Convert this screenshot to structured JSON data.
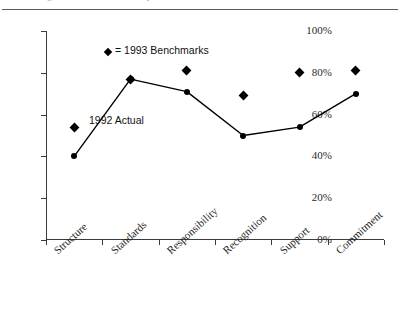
{
  "page": {
    "top_text_sliver": "Exhibit 2  Organizational climate survey results",
    "background_color": "#ffffff",
    "ink_color": "#000000"
  },
  "chart_data": {
    "type": "line",
    "title": "",
    "subtitle": "",
    "xlabel": "",
    "ylabel": "",
    "ylim": [
      0,
      100
    ],
    "y_unit": "%",
    "grid": false,
    "legend_position": "inside-top-center",
    "categories": [
      "Structure",
      "Standards",
      "Responsibility",
      "Recognition",
      "Support",
      "Commitment"
    ],
    "y_ticks": [
      0,
      20,
      40,
      60,
      80,
      100
    ],
    "y_tick_labels": [
      "0%",
      "20%",
      "40%",
      "60%",
      "80%",
      "100%"
    ],
    "series": [
      {
        "name": "1992 Actual",
        "marker": "circle",
        "line": true,
        "color": "#000000",
        "values": [
          40,
          77,
          71,
          50,
          54,
          70
        ]
      },
      {
        "name": "1993 Benchmarks",
        "marker": "diamond",
        "line": false,
        "color": "#000000",
        "values": [
          54,
          77,
          81,
          69,
          80,
          81
        ]
      }
    ],
    "annotations": [
      {
        "id": "legend-benchmarks",
        "text": "= 1993 Benchmarks",
        "marker": "diamond"
      },
      {
        "id": "series-label-actual",
        "text": "1992 Actual"
      }
    ]
  }
}
